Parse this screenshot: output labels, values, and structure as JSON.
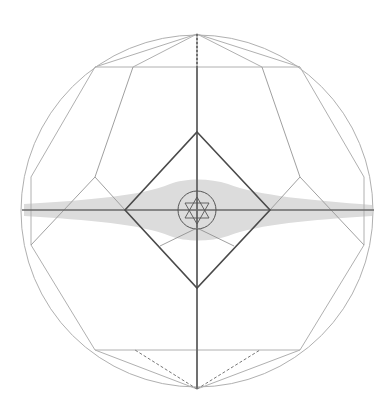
{
  "diagram": {
    "title": "Geometric construction: circumscribed polygon, diamond and hexagram",
    "colors": {
      "background": "#ffffff",
      "thin_line": "#b5b5b5",
      "medium_line": "#8a8a8a",
      "dark_line": "#4a4a4a",
      "axis": "#6e6e6e",
      "halo_fill": "#d9d9d9"
    },
    "circle": {
      "cx": 197,
      "cy": 211,
      "r": 176
    },
    "axes": {
      "vertical": {
        "x": 197,
        "y1": 34,
        "y2": 389
      },
      "horizontal": {
        "y": 210,
        "x1": 22,
        "x2": 374
      }
    },
    "outer_polygon": "197,34 300,67 364,177 364,245 300,350 197,389 95,350 31,245 31,177 95,67",
    "top_fan": [
      "197,34 95,67",
      "197,34 133,67",
      "197,34 262,67",
      "197,34 300,67"
    ],
    "top_edge": {
      "x1": 95,
      "x2": 300,
      "y": 67
    },
    "bottom_edge": {
      "x1": 95,
      "x2": 300,
      "y": 350
    },
    "bottom_fan_solid": [
      "197,389 95,350",
      "197,389 300,350"
    ],
    "bottom_fan_dashed": [
      "197,389 135,350",
      "197,389 260,350"
    ],
    "inner_left": "133,67 95,177 125,210",
    "inner_right": "262,67 300,177 270,210",
    "diag_left": "95,177 31,245",
    "diag_right": "300,177 364,245",
    "diamond": "197,132 270,210 197,288 125,210",
    "lower_v": "125,210 197,288 270,210",
    "small_circle": {
      "cx": 197,
      "cy": 210,
      "r": 19
    },
    "hexagram": {
      "up": "197,198 208,218 186,218",
      "down": "197,222 208,202 186,202"
    }
  }
}
